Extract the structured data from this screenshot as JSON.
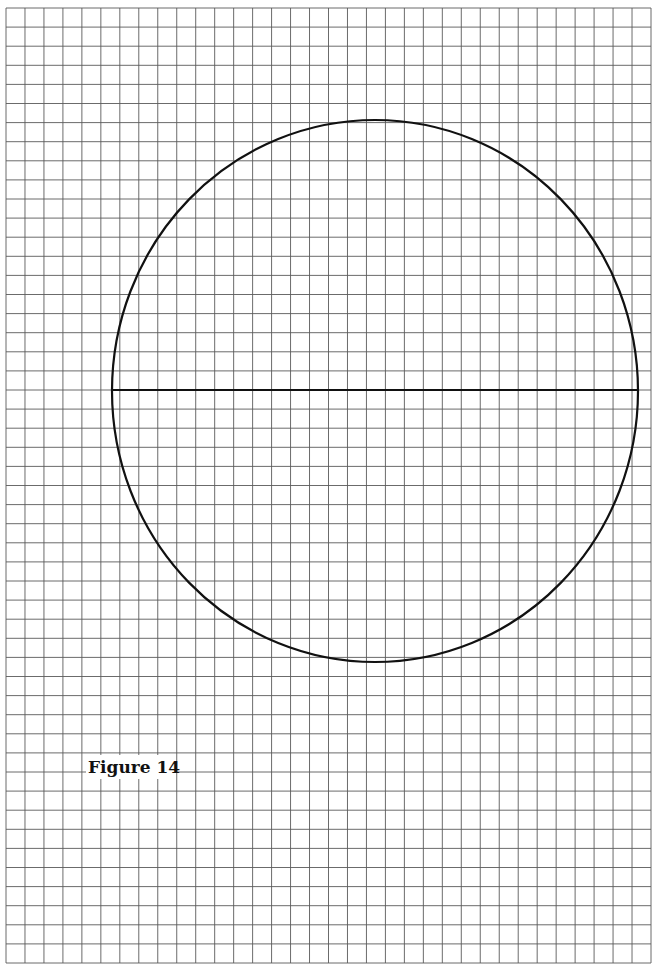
{
  "figure": {
    "label": "Figure 14",
    "grid": {
      "columns": 34,
      "rows": 50,
      "line_color": "#5a5a5a"
    },
    "shapes": [
      {
        "type": "circle",
        "name": "circle"
      },
      {
        "type": "segment",
        "name": "diameter"
      }
    ],
    "stroke_color": "#111111",
    "background_color": "#ffffff"
  }
}
